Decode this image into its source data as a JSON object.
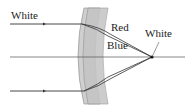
{
  "diagram": {
    "labels": {
      "incoming_ray": "White",
      "red_ray": "Red",
      "blue_ray": "Blue",
      "focus": "White"
    },
    "colors": {
      "lens_fill": "#c8c8c8",
      "lens_stroke": "#8a8a8a",
      "ray": "#333333",
      "axis": "#555555",
      "text": "#222222"
    }
  }
}
